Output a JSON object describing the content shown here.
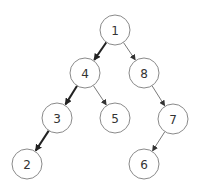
{
  "diagram": {
    "type": "binary-tree",
    "node_radius": 15,
    "colors": {
      "background": "#ffffff",
      "node_stroke": "#8a8a8a",
      "label": "#333333",
      "edge_thin": "#7a7a7a",
      "edge_highlight": "#222222"
    },
    "nodes": [
      {
        "id": "1",
        "label": "1",
        "x": 115,
        "y": 30
      },
      {
        "id": "4",
        "label": "4",
        "x": 85,
        "y": 73
      },
      {
        "id": "8",
        "label": "8",
        "x": 144,
        "y": 73
      },
      {
        "id": "3",
        "label": "3",
        "x": 57,
        "y": 118
      },
      {
        "id": "5",
        "label": "5",
        "x": 115,
        "y": 118
      },
      {
        "id": "7",
        "label": "7",
        "x": 173,
        "y": 119
      },
      {
        "id": "2",
        "label": "2",
        "x": 27,
        "y": 164
      },
      {
        "id": "6",
        "label": "6",
        "x": 144,
        "y": 164
      }
    ],
    "edges": [
      {
        "from": "1",
        "to": "4",
        "highlight": true
      },
      {
        "from": "1",
        "to": "8",
        "highlight": false
      },
      {
        "from": "4",
        "to": "3",
        "highlight": true
      },
      {
        "from": "4",
        "to": "5",
        "highlight": false
      },
      {
        "from": "8",
        "to": "7",
        "highlight": false
      },
      {
        "from": "3",
        "to": "2",
        "highlight": true
      },
      {
        "from": "7",
        "to": "6",
        "highlight": false
      }
    ]
  }
}
